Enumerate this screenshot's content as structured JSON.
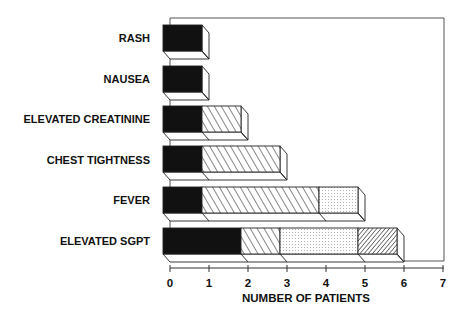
{
  "chart_data": {
    "type": "bar",
    "orientation": "horizontal",
    "stacked": true,
    "style": "3d",
    "title": "",
    "xlabel": "NUMBER OF PATIENTS",
    "ylabel": "",
    "xlim": [
      0,
      7
    ],
    "x_ticks": [
      0,
      1,
      2,
      3,
      4,
      5,
      6,
      7
    ],
    "grid": false,
    "legend": null,
    "categories": [
      "RASH",
      "NAUSEA",
      "ELEVATED CREATININE",
      "CHEST TIGHTNESS",
      "FEVER",
      "ELEVATED SGPT"
    ],
    "series": [
      {
        "name": "solid black",
        "pattern": "solid",
        "values": [
          1,
          1,
          1,
          1,
          1,
          2
        ]
      },
      {
        "name": "sparse diagonal hatch",
        "pattern": "hatch-sparse",
        "values": [
          0,
          0,
          1,
          2,
          3,
          1
        ]
      },
      {
        "name": "dotted",
        "pattern": "dots",
        "values": [
          0,
          0,
          0,
          0,
          1,
          2
        ]
      },
      {
        "name": "dense diagonal hatch",
        "pattern": "hatch-dense",
        "values": [
          0,
          0,
          0,
          0,
          0,
          1
        ]
      }
    ],
    "totals": [
      1,
      1,
      2,
      3,
      5,
      6
    ]
  },
  "axis": {
    "tick_labels": [
      "0",
      "1",
      "2",
      "3",
      "4",
      "5",
      "6",
      "7"
    ],
    "title": "NUMBER OF PATIENTS"
  },
  "labels": {
    "cat0": "RASH",
    "cat1": "NAUSEA",
    "cat2": "ELEVATED CREATININE",
    "cat3": "CHEST TIGHTNESS",
    "cat4": "FEVER",
    "cat5": "ELEVATED SGPT"
  },
  "colors": {
    "ink": "#111111",
    "background": "#ffffff",
    "frame": "#555555"
  }
}
